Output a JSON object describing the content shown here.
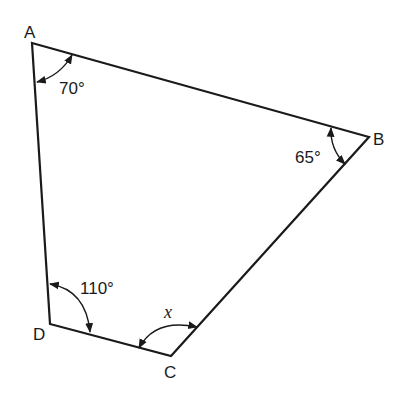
{
  "diagram": {
    "type": "quadrilateral",
    "vertices": [
      {
        "label": "A",
        "x": 32,
        "y": 43
      },
      {
        "label": "B",
        "x": 369,
        "y": 137
      },
      {
        "label": "C",
        "x": 171,
        "y": 356
      },
      {
        "label": "D",
        "x": 50,
        "y": 324
      }
    ],
    "angles": {
      "A": "70°",
      "B": "65°",
      "D": "110°",
      "C": "x"
    },
    "colors": {
      "stroke": "#1a1a1a",
      "background": "#ffffff"
    }
  }
}
